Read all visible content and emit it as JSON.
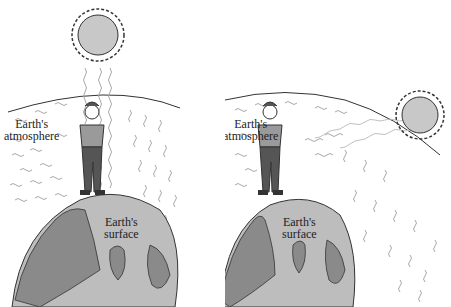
{
  "panels": [
    {
      "id": "left",
      "description": "Sun directly overhead",
      "atmosphere_label": [
        "Earth's",
        "atmosphere"
      ],
      "surface_label": [
        "Earth's",
        "surface"
      ]
    },
    {
      "id": "right",
      "description": "Sun near horizon",
      "atmosphere_label": [
        "Earth's",
        "atmosphere"
      ],
      "surface_label": [
        "Earth's",
        "surface"
      ]
    }
  ],
  "colors": {
    "background": "#ffffff",
    "outline": "#333333",
    "sun_fill": "#c8c8c8",
    "earth_ocean": "#bdbdbd",
    "earth_land": "#8a8a8a",
    "wave": "#a8a8a8",
    "shirt": "#9a9a9a",
    "pants": "#555555"
  }
}
